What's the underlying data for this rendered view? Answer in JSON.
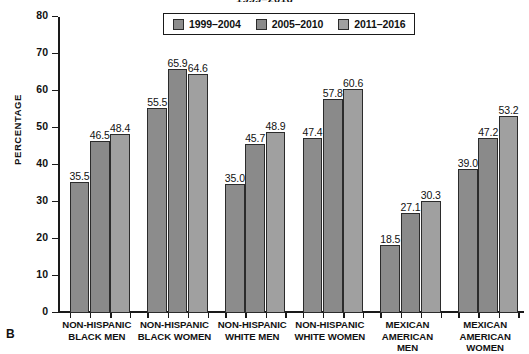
{
  "figure": {
    "panel_letter": "B",
    "suptitle": "1999–2016"
  },
  "legend": {
    "items": [
      {
        "label": "1999–2004",
        "color": "#8c8c8c"
      },
      {
        "label": "2005–2010",
        "color": "#8a8a8a"
      },
      {
        "label": "2011–2016",
        "color": "#a0a0a0"
      }
    ]
  },
  "axes": {
    "ylabel": "PERCENTAGE",
    "yticks": [
      "0",
      "10",
      "20",
      "30",
      "40",
      "50",
      "60",
      "70",
      "80"
    ]
  },
  "chart_data": {
    "type": "bar",
    "title": "1999–2016",
    "xlabel": "",
    "ylabel": "PERCENTAGE",
    "ylim": [
      0,
      80
    ],
    "ytick_step": 10,
    "grid": false,
    "legend_position": "top-center",
    "categories": [
      "NON-HISPANIC BLACK MEN",
      "NON-HISPANIC BLACK WOMEN",
      "NON-HISPANIC WHITE MEN",
      "NON-HISPANIC WHITE WOMEN",
      "MEXICAN AMERICAN MEN",
      "MEXICAN AMERICAN WOMEN"
    ],
    "category_lines": [
      [
        "NON-HISPANIC",
        "BLACK MEN"
      ],
      [
        "NON-HISPANIC",
        "BLACK WOMEN"
      ],
      [
        "NON-HISPANIC",
        "WHITE MEN"
      ],
      [
        "NON-HISPANIC",
        "WHITE WOMEN"
      ],
      [
        "MEXICAN",
        "AMERICAN",
        "MEN"
      ],
      [
        "MEXICAN",
        "AMERICAN",
        "WOMEN"
      ]
    ],
    "series": [
      {
        "name": "1999–2004",
        "color": "#8c8c8c",
        "values": [
          35.5,
          55.5,
          35.0,
          47.4,
          18.5,
          39.0
        ]
      },
      {
        "name": "2005–2010",
        "color": "#8a8a8a",
        "values": [
          46.5,
          65.9,
          45.7,
          57.8,
          27.1,
          47.2
        ]
      },
      {
        "name": "2011–2016",
        "color": "#a0a0a0",
        "values": [
          48.4,
          64.6,
          48.9,
          60.6,
          30.3,
          53.2
        ]
      }
    ],
    "value_labels": [
      [
        "35.5",
        "46.5",
        "48.4"
      ],
      [
        "55.5",
        "65.9",
        "64.6"
      ],
      [
        "35.0",
        "45.7",
        "48.9"
      ],
      [
        "47.4",
        "57.8",
        "60.6"
      ],
      [
        "18.5",
        "27.1",
        "30.3"
      ],
      [
        "39.0",
        "47.2",
        "53.2"
      ]
    ]
  }
}
